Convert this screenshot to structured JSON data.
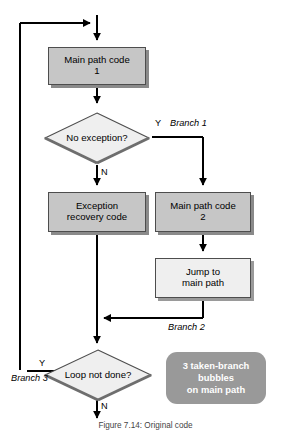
{
  "figure": {
    "type": "flowchart",
    "caption": "Figure 7.14: Original code",
    "accent_box_fill": "#c6c6c6",
    "accent_box_light_fill": "#efefef",
    "callout_fill": "#999999",
    "line_color": "#000000"
  },
  "nodes": {
    "main_path_1": {
      "line1": "Main path code",
      "line2": "1"
    },
    "no_exception": {
      "label": "No exception?"
    },
    "exception_recovery": {
      "line1": "Exception",
      "line2": "recovery code"
    },
    "main_path_2": {
      "line1": "Main path code",
      "line2": "2"
    },
    "jump_to_main": {
      "line1": "Jump to",
      "line2": "main path"
    },
    "loop_not_done": {
      "label": "Loop not done?"
    },
    "callout": {
      "line1": "3 taken-branch",
      "line2": "bubbles",
      "line3": "on main path"
    }
  },
  "edge_labels": {
    "exception_yes": "Y",
    "exception_no": "N",
    "loop_yes": "Y",
    "loop_no": "N",
    "branch_1": "Branch 1",
    "branch_2": "Branch 2",
    "branch_3": "Branch 3"
  }
}
